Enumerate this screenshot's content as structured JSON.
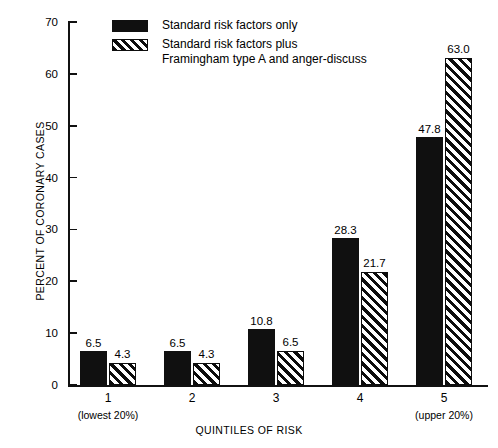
{
  "chart_data": {
    "type": "bar",
    "title": "",
    "xlabel": "QUINTILES OF RISK",
    "ylabel": "PERCENT OF CORONARY CASES",
    "categories": [
      "1",
      "2",
      "3",
      "4",
      "5"
    ],
    "ylim": [
      0,
      70
    ],
    "yticks": [
      0,
      10,
      20,
      30,
      40,
      50,
      60,
      70
    ],
    "grid": false,
    "legend_position": "top-center",
    "series": [
      {
        "name": "Standard risk factors only",
        "fill": "solid-black",
        "values": [
          6.5,
          6.5,
          10.8,
          28.3,
          47.8
        ],
        "labels": [
          "6.5",
          "6.5",
          "10.8",
          "28.3",
          "47.8"
        ]
      },
      {
        "name": "Standard risk factors plus Framingham type A and anger-discuss",
        "fill": "diagonal-hatch",
        "values": [
          4.3,
          4.3,
          6.5,
          21.7,
          63.0
        ],
        "labels": [
          "4.3",
          "4.3",
          "6.5",
          "21.7",
          "63.0"
        ]
      }
    ],
    "annotations": [
      {
        "text": "(lowest 20%)",
        "near_category": "1"
      },
      {
        "text": "(upper 20%)",
        "near_category": "5"
      }
    ],
    "colors": {
      "series_1": "#101010",
      "series_2_hatch": "#0d0d0d",
      "background": "#ffffff",
      "axis": "#111111"
    }
  },
  "legend": {
    "entries": [
      {
        "line1": "Standard risk factors only",
        "line2": ""
      },
      {
        "line1": "Standard risk factors plus",
        "line2": "Framingham  type A and anger-discuss"
      }
    ]
  },
  "axes": {
    "y_title": "PERCENT OF CORONARY CASES",
    "x_title": "QUINTILES OF RISK",
    "y_tick_labels": [
      "70",
      "60",
      "50",
      "40",
      "30",
      "20",
      "10",
      "0"
    ],
    "x_tick_labels": [
      "1",
      "2",
      "3",
      "4",
      "5"
    ],
    "x_note_left": "(lowest 20%)",
    "x_note_right": "(upper 20%)"
  },
  "caption": {
    "text": ""
  }
}
